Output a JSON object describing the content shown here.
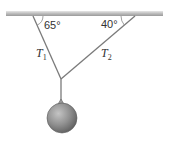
{
  "diagram": {
    "type": "physics-tension-diagram",
    "ceiling": {
      "color": "#b8b8b8"
    },
    "angles": {
      "left": "65°",
      "right": "40°"
    },
    "tensions": {
      "left": {
        "symbol": "T",
        "subscript": "1"
      },
      "right": {
        "symbol": "T",
        "subscript": "2"
      }
    },
    "colors": {
      "string": "#7a7a7a",
      "ball": "#8a8a8a",
      "text": "#333333"
    }
  }
}
